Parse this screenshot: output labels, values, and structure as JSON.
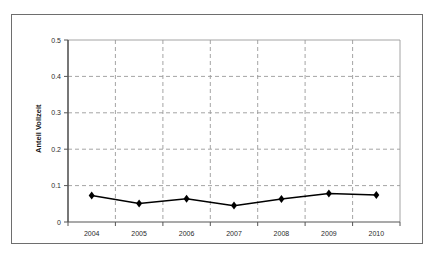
{
  "chart_data": {
    "type": "line",
    "title": "",
    "xlabel": "",
    "ylabel": "Anteil Vollzeit",
    "categories": [
      "2004",
      "2005",
      "2006",
      "2007",
      "2008",
      "2009",
      "2010"
    ],
    "values": [
      0.073,
      0.051,
      0.064,
      0.045,
      0.063,
      0.078,
      0.074
    ],
    "series": [
      {
        "name": "Anteil Vollzeit",
        "values": [
          0.073,
          0.051,
          0.064,
          0.045,
          0.063,
          0.078,
          0.074
        ]
      }
    ],
    "ylim": [
      0,
      0.5
    ],
    "ytick_labels": [
      "0",
      "0.1",
      "0.2",
      "0.3",
      "0.4",
      "0.5"
    ],
    "ytick_values": [
      0,
      0.1,
      0.2,
      0.3,
      0.4,
      0.5
    ],
    "grid": {
      "horizontal": true,
      "vertical": true,
      "style": "dashed"
    },
    "legend": {
      "visible": false,
      "position": "none"
    },
    "marker": {
      "shape": "diamond",
      "color": "#000000"
    },
    "line": {
      "color": "#000000",
      "width": 1.4
    },
    "axis_color": "#555555",
    "grid_color": "#9a9a9a",
    "background": "#ffffff",
    "frame_border_color": "#6e6e6e"
  }
}
